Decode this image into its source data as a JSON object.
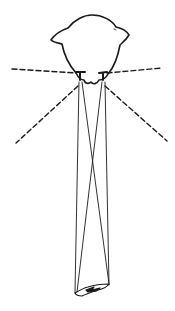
{
  "diagram": {
    "colors": {
      "ink": "#1a1a1a",
      "background": "#ffffff"
    },
    "elements": {
      "head": "head-outline",
      "eyes": [
        "left-eye",
        "right-eye"
      ],
      "visual_field_boundaries": [
        "left-horizontal-dashed",
        "right-horizontal-dashed",
        "left-diagonal-dashed",
        "right-diagonal-dashed"
      ],
      "sight_lines": [
        "left-eye-outer",
        "left-eye-cross",
        "right-eye-outer",
        "right-eye-cross"
      ],
      "target": "prey"
    }
  }
}
